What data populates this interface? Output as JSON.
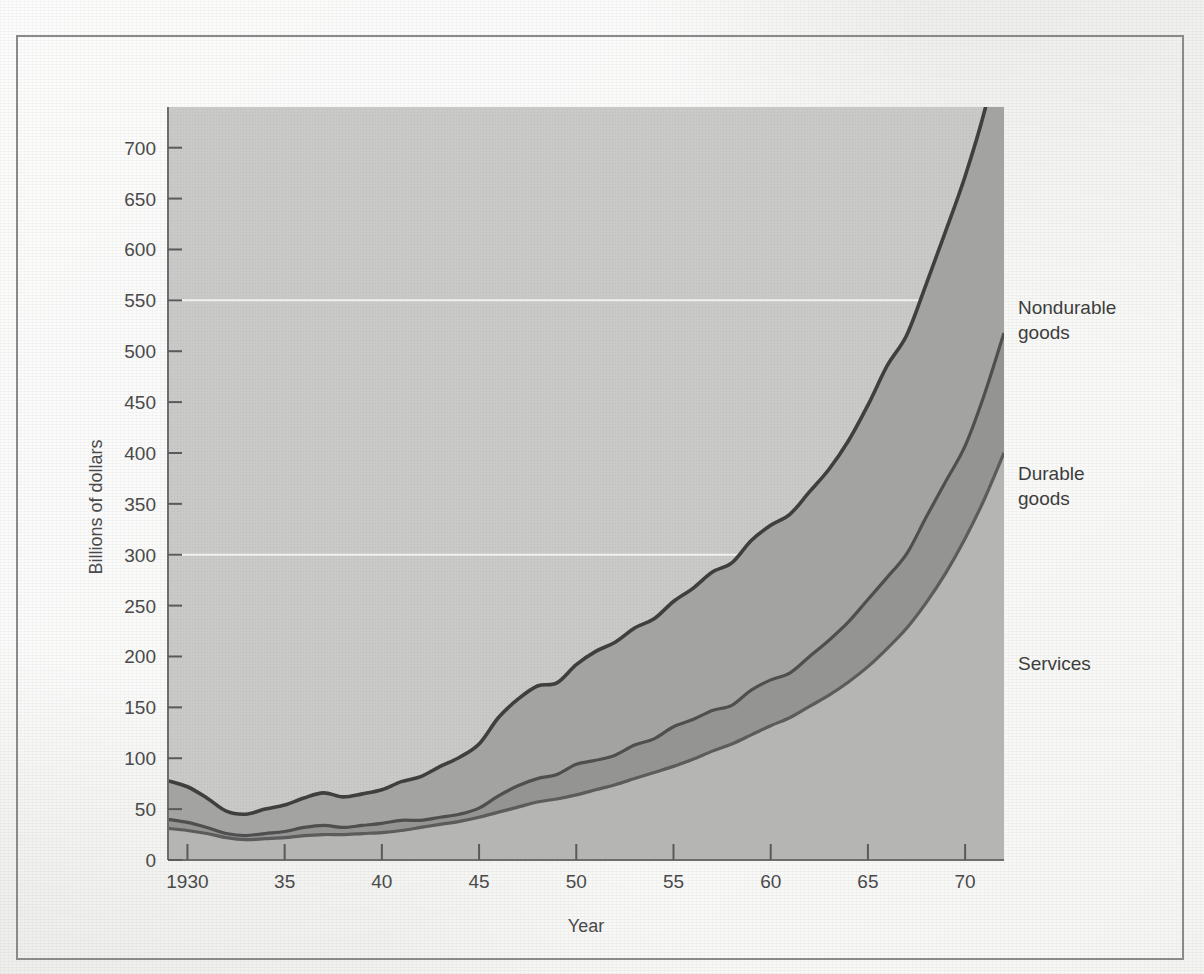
{
  "figure": {
    "background_color": "#f1f1ef",
    "frame_color": "#8a8a8a"
  },
  "chart_data": {
    "type": "area",
    "stacked": true,
    "title": "",
    "subtitle": "",
    "xlabel": "Year",
    "ylabel": "Billions of dollars",
    "xlim": [
      1929,
      1972
    ],
    "ylim": [
      0,
      740
    ],
    "yticks": [
      0,
      50,
      100,
      150,
      200,
      250,
      300,
      350,
      400,
      450,
      500,
      550,
      600,
      650,
      700
    ],
    "ytick_labels": [
      "0",
      "50",
      "100",
      "150",
      "200",
      "250",
      "300",
      "350",
      "400",
      "450",
      "500",
      "550",
      "600",
      "650",
      "700"
    ],
    "xticks": [
      1930,
      1935,
      1940,
      1945,
      1950,
      1955,
      1960,
      1965,
      1970
    ],
    "xtick_labels": [
      "1930",
      "35",
      "40",
      "45",
      "50",
      "55",
      "60",
      "65",
      "70"
    ],
    "grid": "horizontal-faint",
    "gridlines": [
      300,
      550
    ],
    "legend_position": "right-inline",
    "x": [
      1929,
      1930,
      1931,
      1932,
      1933,
      1934,
      1935,
      1936,
      1937,
      1938,
      1939,
      1940,
      1941,
      1942,
      1943,
      1944,
      1945,
      1946,
      1947,
      1948,
      1949,
      1950,
      1951,
      1952,
      1953,
      1954,
      1955,
      1956,
      1957,
      1958,
      1959,
      1960,
      1961,
      1962,
      1963,
      1964,
      1965,
      1966,
      1967,
      1968,
      1969,
      1970,
      1971,
      1972
    ],
    "series": [
      {
        "name": "Services",
        "color": "#b5b5b3",
        "stroke": "#5c5c5c",
        "values": [
          31,
          29,
          26,
          22,
          20,
          21,
          22,
          24,
          25,
          25,
          26,
          27,
          29,
          32,
          35,
          38,
          42,
          47,
          52,
          57,
          60,
          64,
          69,
          74,
          80,
          86,
          92,
          99,
          107,
          114,
          123,
          132,
          140,
          151,
          162,
          175,
          190,
          208,
          228,
          253,
          282,
          316,
          355,
          400
        ]
      },
      {
        "name": "Durable goods",
        "color": "#949492",
        "stroke": "#4f4f4f",
        "values": [
          9,
          8,
          6,
          4,
          4,
          5,
          6,
          8,
          9,
          7,
          8,
          9,
          10,
          7,
          7,
          7,
          9,
          16,
          21,
          23,
          24,
          30,
          29,
          29,
          33,
          33,
          39,
          39,
          40,
          38,
          44,
          45,
          44,
          49,
          54,
          59,
          66,
          70,
          73,
          84,
          90,
          91,
          103,
          118
        ]
      },
      {
        "name": "Nondurable goods",
        "color": "#a3a3a1",
        "stroke": "#3f3f3f",
        "values": [
          38,
          35,
          29,
          22,
          21,
          24,
          26,
          29,
          32,
          30,
          31,
          33,
          38,
          43,
          50,
          56,
          63,
          77,
          85,
          91,
          90,
          98,
          107,
          111,
          115,
          118,
          123,
          129,
          136,
          140,
          147,
          152,
          156,
          162,
          168,
          178,
          191,
          208,
          215,
          229,
          246,
          265,
          278,
          300
        ]
      }
    ],
    "totals_note": {
      "start_year_total": 78,
      "end_year_total": 740
    },
    "annotations": [
      {
        "label": "Nondurable goods",
        "x": 1972,
        "y": 580
      },
      {
        "label": "Durable goods",
        "x": 1972,
        "y": 380
      },
      {
        "label": "Services",
        "x": 1972,
        "y": 200
      }
    ]
  },
  "legend": {
    "items": [
      {
        "label_line1": "Nondurable",
        "label_line2": "goods"
      },
      {
        "label_line1": "Durable",
        "label_line2": "goods"
      },
      {
        "label_line1": "Services",
        "label_line2": ""
      }
    ]
  }
}
